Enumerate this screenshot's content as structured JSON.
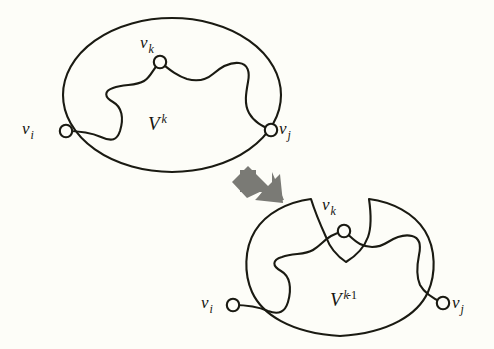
{
  "figure": {
    "background_color": "#fdfdf8",
    "stroke_color": "#1a1a12",
    "arrow_color": "#7a7a75",
    "node_fill": "#fdfdf8"
  },
  "top_panel": {
    "region_label": {
      "base": "V",
      "sup": "k"
    },
    "nodes": [
      {
        "id": "vi",
        "base": "v",
        "sub": "i",
        "cx": 66,
        "cy": 131
      },
      {
        "id": "vk",
        "base": "v",
        "sub": "k",
        "cx": 160,
        "cy": 62
      },
      {
        "id": "vj",
        "base": "v",
        "sub": "j",
        "cx": 271,
        "cy": 130
      }
    ]
  },
  "bottom_panel": {
    "region_label": {
      "base": "V",
      "sup": "k",
      "sup_plain": "-1"
    },
    "nodes": [
      {
        "id": "vi",
        "base": "v",
        "sub": "i",
        "cx": 233,
        "cy": 305
      },
      {
        "id": "vk",
        "base": "v",
        "sub": "k",
        "cx": 344,
        "cy": 231
      },
      {
        "id": "vj",
        "base": "v",
        "sub": "j",
        "cx": 443,
        "cy": 303
      }
    ]
  },
  "arrow": {
    "name": "down-right-block-arrow",
    "color": "#7a7a75"
  }
}
